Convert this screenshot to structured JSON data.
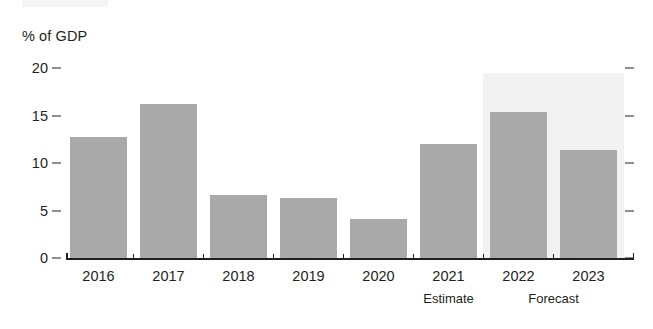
{
  "chart_data": {
    "type": "bar",
    "title": "",
    "subtitle": "",
    "xlabel": "",
    "ylabel": "% of GDP",
    "categories": [
      "2016",
      "2017",
      "2018",
      "2019",
      "2020",
      "2021",
      "2022",
      "2023"
    ],
    "values": [
      12.7,
      16.2,
      6.6,
      6.3,
      4.1,
      12.0,
      15.4,
      11.4
    ],
    "series": [
      {
        "name": "% of GDP",
        "values": [
          12.7,
          16.2,
          6.6,
          6.3,
          4.1,
          12.0,
          15.4,
          11.4
        ]
      }
    ],
    "ylim": [
      0,
      20
    ],
    "yticks": [
      0,
      5,
      10,
      15,
      20
    ],
    "ytick_labels": [
      "0",
      "5",
      "10",
      "15",
      "20"
    ],
    "grid": false,
    "legend": null,
    "bar_color": "#a9a9a9",
    "axis_color": "#231f20",
    "annotations": [
      {
        "text": "Estimate",
        "under_category": "2021"
      },
      {
        "text": "Forecast",
        "under_category_range": [
          "2022",
          "2023"
        ]
      }
    ],
    "shaded_region": {
      "label": "Forecast",
      "from_category": "2022",
      "to_category": "2023",
      "color": "#f2f2f2"
    }
  },
  "axis": {
    "unit_label": "% of GDP"
  }
}
